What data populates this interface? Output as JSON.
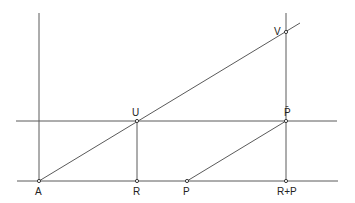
{
  "diagram": {
    "type": "geometric-construction",
    "colors": {
      "line": "#5a5a5a",
      "point_stroke": "#3a3a3a",
      "label": "#222222",
      "background": "#ffffff"
    },
    "points": [
      {
        "id": "A",
        "label": "A",
        "x": 39,
        "y": 181
      },
      {
        "id": "R",
        "label": "R",
        "x": 137,
        "y": 181
      },
      {
        "id": "P",
        "label": "P",
        "x": 187,
        "y": 181
      },
      {
        "id": "RP",
        "label": "R+P",
        "x": 286,
        "y": 181
      },
      {
        "id": "U",
        "label": "U",
        "x": 137,
        "y": 121
      },
      {
        "id": "Pbar",
        "label": "P̄",
        "x": 286,
        "y": 121
      },
      {
        "id": "V",
        "label": "V",
        "x": 286,
        "y": 32
      }
    ],
    "lines": [
      {
        "id": "baseline",
        "from": [
          17,
          181
        ],
        "to": [
          338,
          181
        ]
      },
      {
        "id": "upper-horizontal",
        "from": [
          16,
          121
        ],
        "to": [
          337,
          121
        ]
      },
      {
        "id": "vertical-axis-A",
        "from": [
          39,
          13
        ],
        "to": [
          39,
          181
        ]
      },
      {
        "id": "vertical-R-U",
        "from": [
          137,
          121
        ],
        "to": [
          137,
          181
        ]
      },
      {
        "id": "vertical-RP-V",
        "from": [
          286,
          13
        ],
        "to": [
          286,
          181
        ]
      },
      {
        "id": "diagonal-A-V",
        "from": [
          39,
          181
        ],
        "to": [
          300,
          23
        ]
      },
      {
        "id": "diagonal-P-Pbar",
        "from": [
          187,
          181
        ],
        "to": [
          286,
          121
        ]
      }
    ],
    "labels": {
      "A": "A",
      "R": "R",
      "P": "P",
      "RP": "R+P",
      "U": "U",
      "Pbar": "P̄",
      "V": "V"
    }
  }
}
